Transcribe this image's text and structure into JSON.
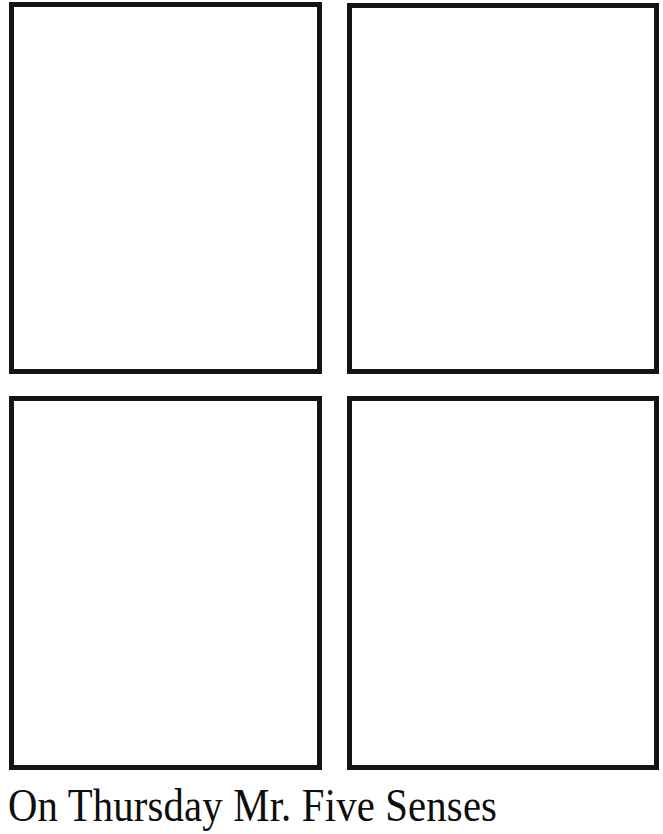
{
  "page": {
    "kind": "printable-worksheet",
    "background_color": "#ffffff",
    "ink_color": "#141414",
    "width_px": 663,
    "height_px": 834
  },
  "panels": {
    "rows": 2,
    "columns": 2,
    "border_color": "#141414",
    "border_width_px": 5,
    "fill_color": "#ffffff",
    "items": [
      {
        "id": "top-left",
        "label": "",
        "content": ""
      },
      {
        "id": "top-right",
        "label": "",
        "content": ""
      },
      {
        "id": "bottom-left",
        "label": "",
        "content": ""
      },
      {
        "id": "bottom-right",
        "label": "",
        "content": ""
      }
    ]
  },
  "caption": {
    "text": "On Thursday Mr. Five Senses",
    "color": "#0d0d0d"
  }
}
